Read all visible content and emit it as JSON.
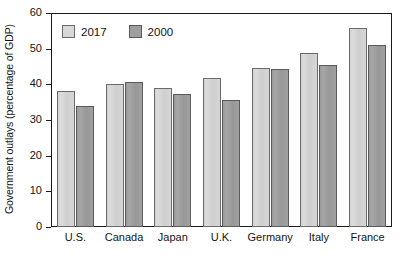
{
  "chart_data": {
    "type": "bar",
    "title": "",
    "xlabel": "",
    "ylabel": "Government outlays (percentage of GDP)",
    "categories": [
      "U.S.",
      "Canada",
      "Japan",
      "U.K.",
      "Germany",
      "Italy",
      "France"
    ],
    "series": [
      {
        "name": "2017",
        "color": "#d8d8d8",
        "values": [
          38.0,
          40.0,
          39.0,
          41.7,
          44.5,
          48.7,
          55.8
        ]
      },
      {
        "name": "2000",
        "color": "#9e9e9e",
        "values": [
          33.8,
          40.7,
          37.2,
          35.5,
          44.4,
          45.4,
          51.0
        ]
      }
    ],
    "ylim": [
      0,
      60
    ],
    "yticks": [
      0,
      10,
      20,
      30,
      40,
      50,
      60
    ],
    "ytick_labels": [
      "0",
      "10",
      "20",
      "30",
      "40",
      "50",
      "60"
    ],
    "grid": false,
    "legend_position": "top-left-inside"
  },
  "legend": {
    "items": [
      {
        "label": "2017"
      },
      {
        "label": "2000"
      }
    ]
  }
}
